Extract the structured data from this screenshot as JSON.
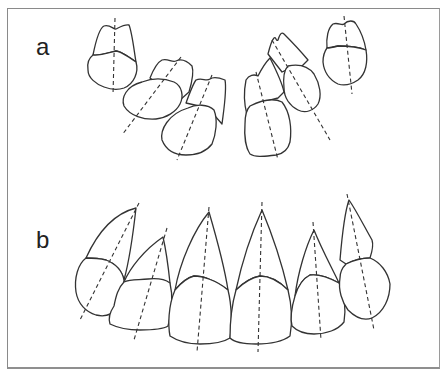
{
  "figure": {
    "panels": [
      {
        "label": "a",
        "description": "Maxillary anterior teeth, crowded arrangement with dashed long axes"
      },
      {
        "label": "b",
        "description": "Maxillary anterior teeth aligned in arch with dashed long axes"
      }
    ],
    "caption": ""
  },
  "colors": {
    "frame": "#8a8a8a",
    "outline": "#333333",
    "background": "#ffffff"
  }
}
